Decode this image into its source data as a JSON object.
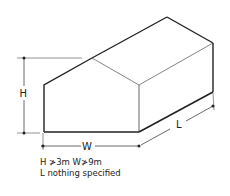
{
  "diagram": {
    "type": "isometric building with pitched roof",
    "labels": {
      "height": "H",
      "width": "W",
      "length": "L"
    },
    "caption": {
      "line1": "H ≯3m   W≯9m",
      "line2": "L  nothing specified"
    },
    "colors": {
      "stroke": "#222222",
      "thin_stroke": "#666666",
      "background": "#ffffff"
    }
  }
}
